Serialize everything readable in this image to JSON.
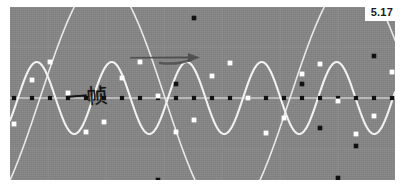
{
  "figure": {
    "corner_label": "5.17",
    "annotation_text": "一帧",
    "annotation_title": "one frame",
    "arrow_label": "direction-arrow",
    "colors": {
      "plot_background": "#858585",
      "grid_line": "#909090",
      "axis_line": "#c9c9c9",
      "signal_curve": "#f2f2f2",
      "alias_curve": "#e8e8e8",
      "sample_dot_on_curve": "#ffffff",
      "sample_dot_on_axis": "#111111",
      "arrow": "#4a4a4a",
      "annotation_ink": "#141414",
      "page_background": "#ffffff",
      "label_background": "#ffffff"
    }
  },
  "chart_data": {
    "type": "line",
    "title": "",
    "subtitle": "",
    "xlabel": "",
    "ylabel": "",
    "grid": true,
    "legend_position": "none",
    "xlim": [
      0,
      385
    ],
    "ylim": [
      -1.35,
      1.35
    ],
    "axis_y_pixel": 91,
    "annotations": [
      {
        "name": "one-frame-label",
        "text": "一帧",
        "x": 56,
        "y": 88
      },
      {
        "name": "right-arrow",
        "text": "",
        "x0": 120,
        "y0": 50,
        "x1": 190,
        "y1": 50
      },
      {
        "name": "figure-number",
        "text": "5.17",
        "x": 378,
        "y": 12
      }
    ],
    "series": [
      {
        "name": "high-frequency-signal",
        "role": "original sine wave",
        "color": "#f2f2f2",
        "period_px": 75,
        "amplitude_px": 36,
        "phase_px": 8,
        "x_start": 0,
        "x_end": 385,
        "marker_color": "#ffffff"
      },
      {
        "name": "aliased-reconstruction",
        "role": "low frequency alias through sample points",
        "color": "#e8e8e8",
        "period_px": 250,
        "amplitude_px": 120,
        "phase_px": 30,
        "x_start": 0,
        "x_end": 385,
        "marker_color": "#111111"
      }
    ],
    "axis_sample_dots_x": [
      4,
      22,
      40,
      58,
      76,
      94,
      112,
      130,
      148,
      166,
      184,
      202,
      220,
      238,
      256,
      274,
      292,
      310,
      328,
      346,
      364,
      382
    ],
    "curve_sample_points": [
      {
        "x": 4,
        "y": -26
      },
      {
        "x": 22,
        "y": 18
      },
      {
        "x": 40,
        "y": 36
      },
      {
        "x": 58,
        "y": 5
      },
      {
        "x": 76,
        "y": -34
      },
      {
        "x": 94,
        "y": -24
      },
      {
        "x": 112,
        "y": 20
      },
      {
        "x": 130,
        "y": 36
      },
      {
        "x": 148,
        "y": 2
      },
      {
        "x": 166,
        "y": -34
      },
      {
        "x": 184,
        "y": -22
      },
      {
        "x": 202,
        "y": 22
      },
      {
        "x": 220,
        "y": 35
      },
      {
        "x": 238,
        "y": 0
      },
      {
        "x": 256,
        "y": -35
      },
      {
        "x": 274,
        "y": -20
      },
      {
        "x": 292,
        "y": 24
      },
      {
        "x": 310,
        "y": 34
      },
      {
        "x": 328,
        "y": -3
      },
      {
        "x": 346,
        "y": -36
      },
      {
        "x": 364,
        "y": -18
      },
      {
        "x": 382,
        "y": 26
      }
    ],
    "alias_sample_points": [
      {
        "x": 148,
        "y": -82
      },
      {
        "x": 166,
        "y": 14
      },
      {
        "x": 184,
        "y": 80
      },
      {
        "x": 238,
        "y": 104
      },
      {
        "x": 292,
        "y": 14
      },
      {
        "x": 310,
        "y": -30
      },
      {
        "x": 328,
        "y": -80
      },
      {
        "x": 346,
        "y": -48
      },
      {
        "x": 364,
        "y": 42
      }
    ],
    "grid_lines_x": [
      38,
      96,
      154,
      212,
      270,
      328
    ],
    "grid_lines_y": [
      40,
      91,
      142
    ]
  }
}
